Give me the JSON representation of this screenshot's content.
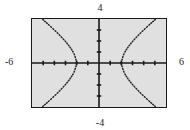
{
  "figure": {
    "kind": "graphing-calculator-plot",
    "background_color": "#ffffff",
    "screen_color": "#e0e0e0",
    "ink_color": "#1a1a1a"
  },
  "labels": {
    "y_max": "4",
    "y_min": "-4",
    "x_min": "-6",
    "x_max": "6"
  },
  "chart_data": {
    "type": "line",
    "title": "",
    "xlabel": "",
    "ylabel": "",
    "xlim": [
      -6,
      6
    ],
    "ylim": [
      -4,
      4
    ],
    "grid": false,
    "legend": "none",
    "axis_style": "centered-crosshair-with-tick-marks",
    "x_tick_interval": 1,
    "y_tick_interval": 1,
    "x_tick_values": [
      -5,
      -4,
      -3,
      -2,
      -1,
      1,
      2,
      3,
      4,
      5
    ],
    "y_tick_values": [
      -3,
      -2,
      -1,
      1,
      2,
      3
    ],
    "curve_style": "dotted-pixel-trace",
    "series": [
      {
        "name": "left-branch-upper",
        "points": [
          [
            -2.0,
            0.0
          ],
          [
            -2.05,
            0.25
          ],
          [
            -2.12,
            0.5
          ],
          [
            -2.2,
            0.75
          ],
          [
            -2.32,
            1.0
          ],
          [
            -2.47,
            1.25
          ],
          [
            -2.64,
            1.5
          ],
          [
            -2.83,
            1.75
          ],
          [
            -3.04,
            2.0
          ],
          [
            -3.26,
            2.25
          ],
          [
            -3.5,
            2.5
          ],
          [
            -3.74,
            2.75
          ],
          [
            -4.0,
            3.0
          ],
          [
            -4.26,
            3.25
          ],
          [
            -4.53,
            3.5
          ],
          [
            -4.81,
            3.75
          ],
          [
            -5.09,
            4.0
          ]
        ]
      },
      {
        "name": "left-branch-lower",
        "points": [
          [
            -2.0,
            0.0
          ],
          [
            -2.05,
            -0.25
          ],
          [
            -2.12,
            -0.5
          ],
          [
            -2.2,
            -0.75
          ],
          [
            -2.32,
            -1.0
          ],
          [
            -2.47,
            -1.25
          ],
          [
            -2.64,
            -1.5
          ],
          [
            -2.83,
            -1.75
          ],
          [
            -3.04,
            -2.0
          ],
          [
            -3.26,
            -2.25
          ],
          [
            -3.5,
            -2.5
          ],
          [
            -3.74,
            -2.75
          ],
          [
            -4.0,
            -3.0
          ],
          [
            -4.26,
            -3.25
          ],
          [
            -4.53,
            -3.5
          ],
          [
            -4.81,
            -3.75
          ],
          [
            -5.09,
            -4.0
          ]
        ]
      },
      {
        "name": "right-branch-upper",
        "points": [
          [
            2.0,
            0.0
          ],
          [
            2.05,
            0.25
          ],
          [
            2.12,
            0.5
          ],
          [
            2.2,
            0.75
          ],
          [
            2.32,
            1.0
          ],
          [
            2.47,
            1.25
          ],
          [
            2.64,
            1.5
          ],
          [
            2.83,
            1.75
          ],
          [
            3.04,
            2.0
          ],
          [
            3.26,
            2.25
          ],
          [
            3.5,
            2.5
          ],
          [
            3.74,
            2.75
          ],
          [
            4.0,
            3.0
          ],
          [
            4.26,
            3.25
          ],
          [
            4.53,
            3.5
          ],
          [
            4.81,
            3.75
          ],
          [
            5.09,
            4.0
          ]
        ]
      },
      {
        "name": "right-branch-lower",
        "points": [
          [
            2.0,
            0.0
          ],
          [
            2.05,
            -0.25
          ],
          [
            2.12,
            -0.5
          ],
          [
            2.2,
            -0.75
          ],
          [
            2.32,
            -1.0
          ],
          [
            2.47,
            -1.25
          ],
          [
            2.64,
            -1.5
          ],
          [
            2.83,
            -1.75
          ],
          [
            3.04,
            -2.0
          ],
          [
            3.26,
            -2.25
          ],
          [
            3.5,
            -2.5
          ],
          [
            3.74,
            -2.75
          ],
          [
            4.0,
            -3.0
          ],
          [
            4.26,
            -3.25
          ],
          [
            4.53,
            -3.5
          ],
          [
            4.81,
            -3.75
          ],
          [
            5.09,
            -4.0
          ]
        ]
      }
    ]
  }
}
